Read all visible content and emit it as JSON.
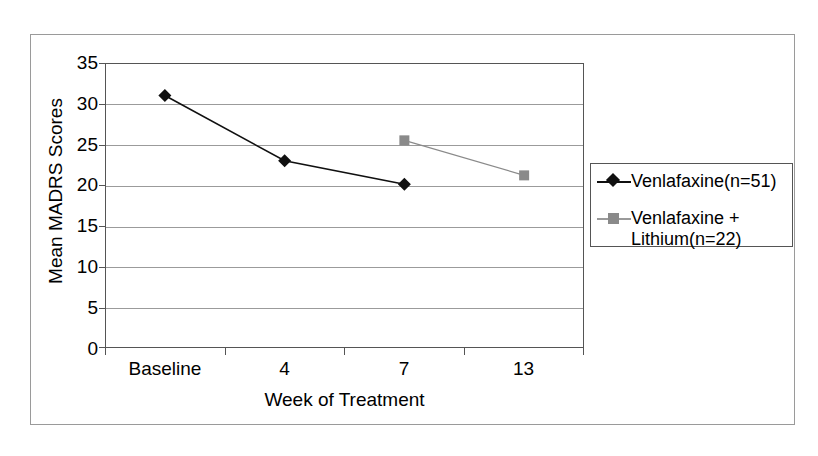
{
  "chart_data": {
    "type": "line",
    "title": "",
    "xlabel": "Week of Treatment",
    "ylabel": "Mean MADRS Scores",
    "categories": [
      "Baseline",
      "4",
      "7",
      "13"
    ],
    "ylim": [
      0,
      35
    ],
    "yticks": [
      0,
      5,
      10,
      15,
      20,
      25,
      30,
      35
    ],
    "ytick_labels": [
      "0",
      "5",
      "10",
      "15",
      "20",
      "25",
      "30",
      "35"
    ],
    "grid": true,
    "legend_position": "right",
    "series": [
      {
        "name": "Venlafaxine(n=51)",
        "marker": "diamond",
        "color": "#101010",
        "x": [
          "Baseline",
          "4",
          "7"
        ],
        "values": [
          31.0,
          23.0,
          20.1
        ]
      },
      {
        "name": "Venlafaxine + Lithium(n=22)",
        "marker": "square",
        "color": "#8a8a8a",
        "x": [
          "7",
          "13"
        ],
        "values": [
          25.5,
          21.2
        ]
      }
    ]
  },
  "legend": {
    "entries": [
      {
        "label": "Venlafaxine(n=51)"
      },
      {
        "label": "Venlafaxine +\nLithium(n=22)"
      }
    ]
  },
  "axes": {
    "y_title": "Mean MADRS Scores",
    "x_title": "Week of Treatment",
    "y_labels": [
      "35",
      "30",
      "25",
      "20",
      "15",
      "10",
      "5",
      "0"
    ],
    "x_labels": [
      "Baseline",
      "4",
      "7",
      "13"
    ]
  }
}
